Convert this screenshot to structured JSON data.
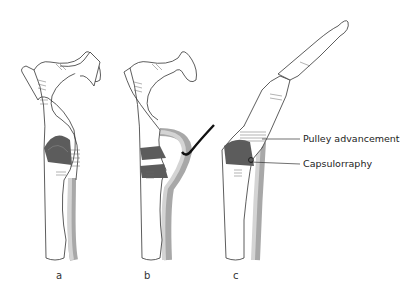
{
  "figure": {
    "panels": [
      {
        "id": "a",
        "label": "a"
      },
      {
        "id": "b",
        "label": "b"
      },
      {
        "id": "c",
        "label": "c"
      }
    ],
    "annotations": [
      {
        "text": "Pulley advancement"
      },
      {
        "text": "Capsulorraphy"
      }
    ],
    "colors": {
      "bone_outline": "#333333",
      "capsule_dark": "#5c5c5c",
      "tendon_light": "#cfcfcf",
      "tendon_mid": "#a8a8a8",
      "hatch": "#666666",
      "suture": "#111111"
    }
  }
}
